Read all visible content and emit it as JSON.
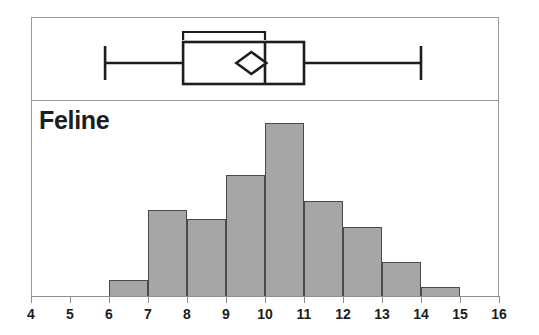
{
  "figure": {
    "series_label": "Feline",
    "background_color": "#ffffff",
    "frame_color": "#9a9a9a",
    "bar_fill_color": "#a6a6a6",
    "bar_outline_color": "#4a4a4a",
    "text_color": "#1d1d1d"
  },
  "chart_data": {
    "type": "bar",
    "title": "Feline",
    "subtitle": "",
    "xlabel": "",
    "ylabel": "",
    "xlim": [
      4,
      16
    ],
    "ylim": [
      0,
      10
    ],
    "grid": false,
    "legend": "none",
    "orientation": "vertical",
    "bin_width": 1,
    "bin_edges": [
      6,
      7,
      8,
      9,
      10,
      11,
      12,
      13,
      14,
      15
    ],
    "categories": [
      "6-7",
      "7-8",
      "8-9",
      "9-10",
      "10-11",
      "11-12",
      "12-13",
      "13-14",
      "14-15"
    ],
    "values": [
      1,
      5,
      4.5,
      7,
      10,
      5.5,
      4,
      2,
      0.6
    ],
    "xticks": [
      4,
      5,
      6,
      7,
      8,
      9,
      10,
      11,
      12,
      13,
      14,
      15,
      16
    ],
    "xtick_labels": [
      "4",
      "5",
      "6",
      "7",
      "8",
      "9",
      "10",
      "11",
      "12",
      "13",
      "14",
      "15",
      "16"
    ],
    "boxplot": {
      "orientation": "horizontal",
      "whisker_low": 5.9,
      "q1": 7.9,
      "median": 10.0,
      "q3": 11.0,
      "whisker_high": 14.0,
      "mean": 9.65,
      "mean_marker": "diamond",
      "confidence_interval": [
        7.9,
        10.0
      ],
      "confidence_bracket": "shortest-half"
    }
  }
}
